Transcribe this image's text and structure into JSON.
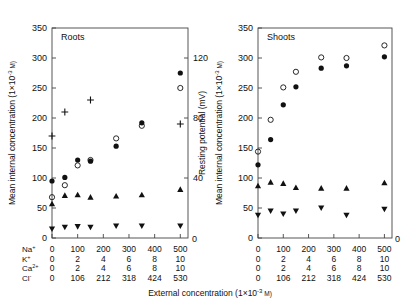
{
  "figure": {
    "x_axis_caption": "External concentration (1×10",
    "x_axis_caption_exp": "-3",
    "x_axis_caption_tail": " M)",
    "y_axis_label": "Mean internal concentration (1×10",
    "y_axis_label_exp": "-3",
    "y_axis_label_tail": " M)",
    "right_axis_label": "Resting potential (mV)",
    "ion_rows": [
      {
        "name": "Na",
        "charge": "+",
        "values": [
          "0",
          "100",
          "200",
          "300",
          "400",
          "500"
        ]
      },
      {
        "name": "K",
        "charge": "+",
        "values": [
          "0",
          "2",
          "4",
          "6",
          "8",
          "10"
        ]
      },
      {
        "name": "Ca",
        "charge": "2+",
        "values": [
          "0",
          "2",
          "4",
          "6",
          "8",
          "10"
        ]
      },
      {
        "name": "Cl",
        "charge": "-",
        "values": [
          "0",
          "106",
          "212",
          "318",
          "424",
          "530"
        ]
      }
    ]
  },
  "chart_data": [
    {
      "type": "scatter",
      "title": "Roots",
      "xlabel": "External concentration (1x10-3 M)",
      "ylabel": "Mean internal concentration (1x10-3 M)",
      "y2label": "Resting potential (mV)",
      "xlim": [
        0,
        530
      ],
      "ylim": [
        0,
        350
      ],
      "y2lim": [
        0,
        140
      ],
      "yticks": [
        0,
        50,
        100,
        150,
        200,
        250,
        300,
        350
      ],
      "y2ticks": [
        40,
        80,
        120
      ],
      "xticks": [
        0,
        100,
        200,
        300,
        400,
        500
      ],
      "grid": false,
      "legend": "none",
      "series": [
        {
          "name": "Na+ (filled circle)",
          "marker": "filled-circle",
          "x": [
            0,
            50,
            100,
            150,
            250,
            350,
            500
          ],
          "y": [
            95,
            101,
            130,
            128,
            153,
            192,
            275
          ]
        },
        {
          "name": "Cl- (open circle)",
          "marker": "open-circle",
          "x": [
            0,
            50,
            100,
            150,
            250,
            350,
            500
          ],
          "y": [
            68,
            88,
            121,
            130,
            166,
            187,
            250
          ]
        },
        {
          "name": "K+ (filled triangle up)",
          "marker": "filled-triangle-up",
          "x": [
            0,
            50,
            100,
            150,
            250,
            350,
            500
          ],
          "y": [
            57,
            71,
            72,
            68,
            70,
            72,
            81
          ]
        },
        {
          "name": "Ca2+ (filled triangle down)",
          "marker": "filled-triangle-down",
          "x": [
            0,
            50,
            100,
            150,
            250,
            350,
            500
          ],
          "y": [
            15,
            18,
            19,
            18,
            20,
            20,
            20
          ]
        },
        {
          "name": "Resting potential (plus)",
          "marker": "plus",
          "x": [
            0,
            50,
            150,
            500
          ],
          "y_mv": [
            68,
            84,
            92,
            76
          ],
          "y": [
            170,
            210,
            230,
            190
          ]
        }
      ]
    },
    {
      "type": "scatter",
      "title": "Shoots",
      "xlabel": "External concentration (1x10-3 M)",
      "ylabel": "Mean internal concentration (1x10-3 M)",
      "xlim": [
        0,
        530
      ],
      "ylim": [
        0,
        350
      ],
      "yticks": [
        0,
        50,
        100,
        150,
        200,
        250,
        300,
        350
      ],
      "xticks": [
        0,
        100,
        200,
        300,
        400,
        500
      ],
      "grid": false,
      "legend": "none",
      "series": [
        {
          "name": "Na+ (filled circle)",
          "marker": "filled-circle",
          "x": [
            0,
            50,
            100,
            150,
            250,
            350,
            500
          ],
          "y": [
            122,
            164,
            222,
            252,
            283,
            287,
            302
          ]
        },
        {
          "name": "Cl- (open circle)",
          "marker": "open-circle",
          "x": [
            0,
            50,
            100,
            150,
            250,
            350,
            500
          ],
          "y": [
            144,
            197,
            251,
            277,
            301,
            300,
            321
          ]
        },
        {
          "name": "K+ (filled triangle up)",
          "marker": "filled-triangle-up",
          "x": [
            0,
            50,
            100,
            150,
            250,
            350,
            500
          ],
          "y": [
            87,
            93,
            91,
            84,
            83,
            83,
            92
          ]
        },
        {
          "name": "Ca2+ (filled triangle down)",
          "marker": "filled-triangle-down",
          "x": [
            0,
            50,
            100,
            150,
            250,
            350,
            500
          ],
          "y": [
            38,
            45,
            40,
            45,
            50,
            38,
            48
          ]
        }
      ]
    }
  ]
}
